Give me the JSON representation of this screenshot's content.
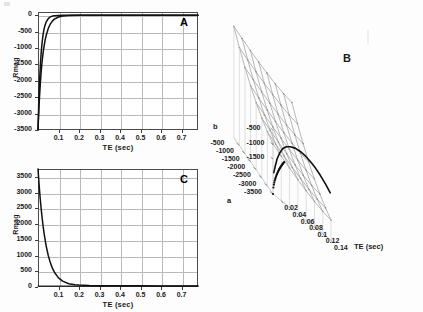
{
  "figure": {
    "background_color": "#fdfdfd",
    "axis_color": "#4a4a4a",
    "grid_color": "#b9b9b9",
    "curve_color": "#111111",
    "mesh_color": "#9a9a9a"
  },
  "panels": {
    "A": {
      "letter": "A",
      "xlabel": "TE (sec)",
      "ylabel": "Rmag",
      "xticks": [
        "0.1",
        "0.2",
        "0.3",
        "0.4",
        "0.5",
        "0.6",
        "0.7"
      ],
      "xtick_values": [
        0.1,
        0.2,
        0.3,
        0.4,
        0.5,
        0.6,
        0.7
      ],
      "yticks": [
        "0",
        "-500",
        "-1000",
        "-1500",
        "-2000",
        "-2500",
        "-3000",
        "-3500"
      ],
      "ytick_values": [
        0,
        -500,
        -1000,
        -1500,
        -2000,
        -2500,
        -3000,
        -3500
      ]
    },
    "B": {
      "letter": "B",
      "xlabel": "TE (sec)",
      "ylabel": "a",
      "zlabel": "b",
      "xticks": [
        "0.02",
        "0.04",
        "0.06",
        "0.08",
        "0.1",
        "0.12",
        "0.14"
      ],
      "xtick_values": [
        0.02,
        0.04,
        0.06,
        0.08,
        0.1,
        0.12,
        0.14
      ],
      "aticks": [
        "-3500",
        "-3000",
        "-2500",
        "-2000",
        "-1500",
        "-1000",
        "-500"
      ],
      "atick_values": [
        -3500,
        -3000,
        -2500,
        -2000,
        -1500,
        -1000,
        -500
      ],
      "bticks": [
        "-500",
        "-1000",
        "-1500"
      ],
      "btick_values": [
        -500,
        -1000,
        -1500
      ]
    },
    "C": {
      "letter": "C",
      "xlabel": "TE (sec)",
      "ylabel": "Rmag",
      "xticks": [
        "0.1",
        "0.2",
        "0.3",
        "0.4",
        "0.5",
        "0.6",
        "0.7"
      ],
      "xtick_values": [
        0.1,
        0.2,
        0.3,
        0.4,
        0.5,
        0.6,
        0.7
      ],
      "yticks": [
        "3500",
        "3000",
        "2500",
        "2000",
        "1500",
        "1000",
        "500",
        "0"
      ],
      "ytick_values": [
        3500,
        3000,
        2500,
        2000,
        1500,
        1000,
        500,
        0
      ]
    }
  },
  "chart_data": [
    {
      "id": "A",
      "type": "line",
      "title": "A",
      "xlabel": "TE (sec)",
      "ylabel": "Rmag",
      "xlim": [
        0.0,
        0.78
      ],
      "ylim": [
        -3500,
        100
      ],
      "grid": true,
      "legend": "none",
      "series": [
        {
          "name": "curve-1",
          "x": [
            0.0,
            0.004,
            0.008,
            0.012,
            0.016,
            0.02,
            0.025,
            0.03,
            0.035,
            0.04,
            0.05,
            0.06,
            0.07,
            0.08,
            0.1,
            0.12,
            0.15,
            0.2,
            0.25,
            0.3,
            0.4,
            0.5,
            0.6,
            0.7,
            0.78
          ],
          "y": [
            -3500,
            -2900,
            -2420,
            -2020,
            -1690,
            -1410,
            -1140,
            -925,
            -750,
            -610,
            -405,
            -268,
            -178,
            -118,
            -52,
            -23,
            -7,
            -1,
            0,
            0,
            0,
            0,
            0,
            0,
            0
          ]
        },
        {
          "name": "curve-2",
          "x": [
            0.0,
            0.004,
            0.008,
            0.012,
            0.016,
            0.02,
            0.025,
            0.03,
            0.035,
            0.04,
            0.05,
            0.06,
            0.07,
            0.08,
            0.1,
            0.12,
            0.15,
            0.2,
            0.25,
            0.3,
            0.4,
            0.5,
            0.6,
            0.7,
            0.78
          ],
          "y": [
            -3500,
            -2620,
            -1960,
            -1470,
            -1100,
            -825,
            -580,
            -408,
            -287,
            -202,
            -100,
            -50,
            -25,
            -12,
            -3,
            -1,
            0,
            0,
            0,
            0,
            0,
            0,
            0,
            0,
            0
          ]
        }
      ]
    },
    {
      "id": "B",
      "type": "line",
      "title": "B",
      "plot_kind": "3d-surface-mesh-with-trajectory",
      "xlabel": "TE (sec)",
      "ylabel": "a",
      "zlabel": "b",
      "xlim": [
        0.01,
        0.15
      ],
      "ylim": [
        -3500,
        -500
      ],
      "zlim": [
        -3500,
        -500
      ],
      "grid": true,
      "legend": "none",
      "description": "Wireframe mesh surface over (TE, a) with a dark valley trajectory curve descending then flattening along the lower front edge.",
      "trajectory": {
        "name": "valley-trajectory",
        "te": [
          0.012,
          0.016,
          0.02,
          0.026,
          0.033,
          0.042,
          0.052,
          0.063,
          0.075,
          0.088,
          0.1,
          0.112,
          0.124,
          0.136,
          0.148
        ],
        "b": [
          -1500,
          -1900,
          -2250,
          -2600,
          -2900,
          -3130,
          -3280,
          -3380,
          -3420,
          -3400,
          -3330,
          -3220,
          -3060,
          -2860,
          -2620
        ]
      }
    },
    {
      "id": "C",
      "type": "line",
      "title": "C",
      "xlabel": "TE (sec)",
      "ylabel": "Rmag",
      "xlim": [
        0.0,
        0.78
      ],
      "ylim": [
        0,
        3750
      ],
      "grid": true,
      "legend": "none",
      "series": [
        {
          "name": "curve-1",
          "x": [
            0.0,
            0.005,
            0.01,
            0.015,
            0.02,
            0.025,
            0.03,
            0.04,
            0.05,
            0.06,
            0.07,
            0.08,
            0.1,
            0.12,
            0.15,
            0.18,
            0.2,
            0.25,
            0.3,
            0.4,
            0.5,
            0.6,
            0.7,
            0.78
          ],
          "y": [
            3750,
            3280,
            2870,
            2510,
            2200,
            1930,
            1690,
            1300,
            1000,
            775,
            600,
            470,
            290,
            185,
            105,
            72,
            62,
            48,
            42,
            38,
            36,
            35,
            34,
            34
          ]
        },
        {
          "name": "baseline",
          "x": [
            0.0,
            0.78
          ],
          "y": [
            30,
            30
          ]
        }
      ]
    }
  ]
}
